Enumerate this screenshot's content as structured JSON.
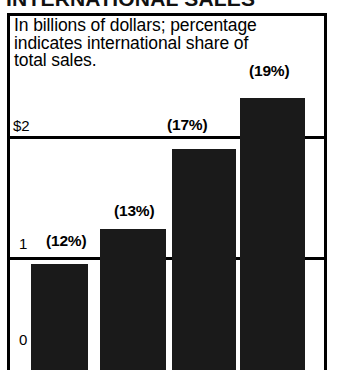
{
  "figure": {
    "title": "INTERNATIONAL SALES",
    "caption_lines": [
      "In billions of dollars; percentage",
      "indicates international share of",
      "total sales."
    ]
  },
  "axis": {
    "y_ticks": [
      {
        "label": "$2",
        "value": 2
      },
      {
        "label": "1",
        "value": 1
      },
      {
        "label": "0",
        "value": 0
      }
    ]
  },
  "chart_data": {
    "type": "bar",
    "title": "INTERNATIONAL SALES",
    "subtitle": "In billions of dollars; percentage indicates international share of total sales.",
    "xlabel": "",
    "ylabel": "In billions of dollars",
    "ylim": [
      0,
      2.95
    ],
    "grid": true,
    "legend": "none",
    "categories": [
      "1",
      "2",
      "3",
      "4"
    ],
    "values": [
      0.95,
      1.26,
      1.97,
      2.43
    ],
    "data_labels": [
      "(12%)",
      "(13%)",
      "(17%)",
      "(19%)"
    ],
    "tick_labels": [
      "$2",
      "1",
      "0"
    ],
    "tick_values": [
      2,
      1,
      0
    ],
    "series": [
      {
        "name": "International sales",
        "values": [
          0.95,
          1.26,
          1.97,
          2.43
        ],
        "percent_share": [
          "12%",
          "13%",
          "17%",
          "19%"
        ]
      }
    ],
    "bars": [
      {
        "index": 0,
        "value": 0.95,
        "label": "(12%)",
        "percent": 12
      },
      {
        "index": 1,
        "value": 1.26,
        "label": "(13%)",
        "percent": 13
      },
      {
        "index": 2,
        "value": 1.97,
        "label": "(17%)",
        "percent": 17
      },
      {
        "index": 3,
        "value": 2.43,
        "label": "(19%)",
        "percent": 19
      }
    ]
  },
  "colors": {
    "bar_fill": "#1a1a1a",
    "frame": "#000000",
    "background": "#ffffff"
  }
}
